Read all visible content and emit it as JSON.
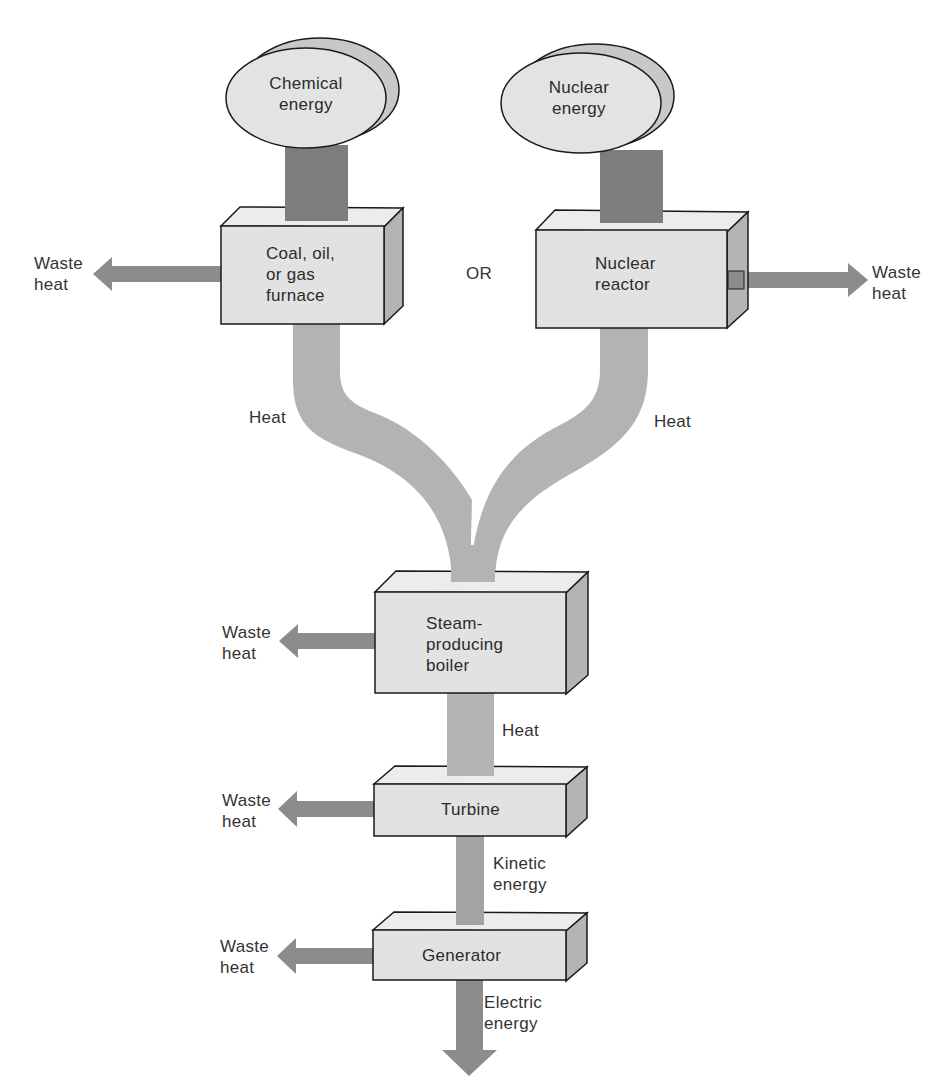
{
  "diagram": {
    "type": "energy-flow",
    "sources": [
      {
        "id": "chemical",
        "label_line1": "Chemical",
        "label_line2": "energy"
      },
      {
        "id": "nuclear",
        "label_line1": "Nuclear",
        "label_line2": "energy"
      }
    ],
    "or_label": "OR",
    "boxes": {
      "furnace": {
        "line1": "Coal, oil,",
        "line2": "or gas",
        "line3": "furnace"
      },
      "reactor": {
        "line1": "Nuclear",
        "line2": "reactor"
      },
      "boiler": {
        "line1": "Steam-",
        "line2": "producing",
        "line3": "boiler"
      },
      "turbine": {
        "line1": "Turbine"
      },
      "generator": {
        "line1": "Generator"
      }
    },
    "flows": {
      "heat_left": "Heat",
      "heat_right": "Heat",
      "heat_boiler": "Heat",
      "kinetic_line1": "Kinetic",
      "kinetic_line2": "energy",
      "electric_line1": "Electric",
      "electric_line2": "energy"
    },
    "waste": {
      "line1": "Waste",
      "line2": "heat"
    },
    "colors": {
      "box_face": "#e2e2e2",
      "box_side": "#b4b4b4",
      "box_top": "#ececec",
      "heat_flow": "#b3b3b3",
      "source_stem": "#7d7d7d",
      "arrow": "#8c8c8c",
      "outline": "#1a1a1a"
    }
  }
}
